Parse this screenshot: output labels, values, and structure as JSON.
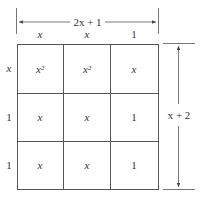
{
  "diagram": {
    "top_dimension": "2x + 1",
    "side_dimension": "x + 2",
    "column_headers": [
      "x",
      "x",
      "1"
    ],
    "row_headers": [
      "x",
      "1",
      "1"
    ],
    "cells": [
      [
        "x²",
        "x²",
        "x"
      ],
      [
        "x",
        "x",
        "1"
      ],
      [
        "x",
        "x",
        "1"
      ]
    ],
    "colors": {
      "line": "#555555",
      "text": "#333333",
      "background": "#ffffff"
    }
  }
}
